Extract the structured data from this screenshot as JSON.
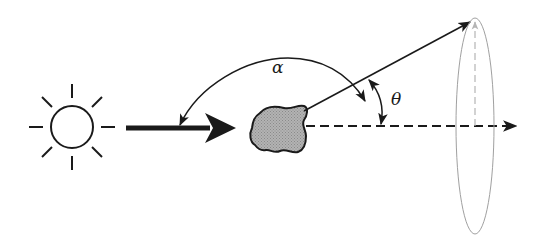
{
  "diagram": {
    "labels": {
      "alpha": "α",
      "theta": "θ"
    },
    "elements": {
      "sun": "light source (sun)",
      "incident_beam": "incident light arrow",
      "particle": "irregular scattering particle",
      "scattered_ray": "scattered ray",
      "forward_direction": "forward direction (dashed)",
      "scattering_cone": "cone / ellipse of directions"
    },
    "colors": {
      "stroke": "#1a1a1a",
      "particle_fill": "#a9a9a9",
      "ellipse": "#9a9a9a",
      "background": "#ffffff"
    }
  }
}
